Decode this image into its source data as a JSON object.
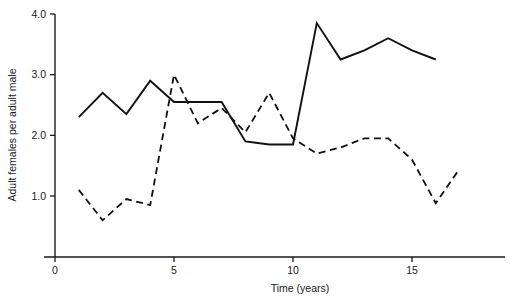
{
  "chart_data": {
    "type": "line",
    "title": "",
    "subtitle": "",
    "xlabel": "Time (years)",
    "ylabel": "Adult females per adult male",
    "xlim": [
      0,
      18
    ],
    "ylim": [
      0,
      4.0
    ],
    "xticks": [
      0,
      5,
      10,
      15
    ],
    "xtick_labels": [
      "0",
      "5",
      "10",
      "15"
    ],
    "yticks": [
      1.0,
      2.0,
      3.0,
      4.0
    ],
    "ytick_labels": [
      "1.0",
      "2.0",
      "3.0",
      "4.0"
    ],
    "grid": false,
    "legend": null,
    "legend_position": "none",
    "annotations": [],
    "series": [
      {
        "name": "solid-series",
        "style": "solid",
        "color": "#111111",
        "x": [
          1,
          2,
          3,
          4,
          5,
          6,
          7,
          8,
          9,
          10,
          11,
          12,
          13,
          14,
          15,
          16
        ],
        "values": [
          2.3,
          2.7,
          2.35,
          2.9,
          2.55,
          2.55,
          2.55,
          1.9,
          1.85,
          1.85,
          3.85,
          3.25,
          3.4,
          3.6,
          3.4,
          3.25
        ]
      },
      {
        "name": "dashed-series",
        "style": "dashed",
        "color": "#111111",
        "x": [
          1,
          2,
          3,
          4,
          5,
          6,
          7,
          8,
          9,
          10,
          11,
          12,
          13,
          14,
          15,
          16,
          17
        ],
        "values": [
          1.1,
          0.6,
          0.95,
          0.85,
          3.0,
          2.2,
          2.45,
          2.05,
          2.7,
          1.95,
          1.7,
          1.8,
          1.95,
          1.95,
          1.6,
          0.88,
          1.45
        ]
      }
    ]
  }
}
